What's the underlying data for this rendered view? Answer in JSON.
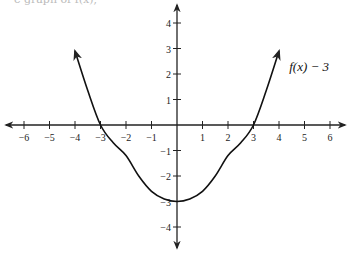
{
  "header": {
    "clipped_text": "e graph of f(x),"
  },
  "chart_data": {
    "type": "line",
    "title": "",
    "xlabel": "",
    "ylabel": "",
    "xlim": [
      -6.5,
      6.5
    ],
    "ylim": [
      -4.8,
      4.8
    ],
    "grid": false,
    "x_ticks": [
      -6,
      -5,
      -4,
      -3,
      -2,
      -1,
      1,
      2,
      3,
      4,
      5,
      6
    ],
    "y_ticks": [
      -4,
      -3,
      -2,
      -1,
      1,
      2,
      3,
      4
    ],
    "series": [
      {
        "name": "f(x) − 3",
        "x": [
          -4,
          -3.5,
          -3,
          -2.5,
          -2,
          -1.5,
          -1,
          -0.5,
          0,
          0.5,
          1,
          1.5,
          2,
          2.5,
          3,
          3.5,
          4
        ],
        "y": [
          2.9,
          1.35,
          0,
          -0.7,
          -1.2,
          -2.0,
          -2.6,
          -2.9,
          -3,
          -2.9,
          -2.6,
          -2.0,
          -1.2,
          -0.7,
          0,
          1.35,
          2.9
        ],
        "arrows_both_ends": true
      }
    ],
    "annotations": [
      {
        "text": "f(x) − 3",
        "x": 4.4,
        "y": 2.1
      }
    ],
    "intercepts": {
      "x": [
        -3,
        3
      ],
      "y": -3
    }
  }
}
